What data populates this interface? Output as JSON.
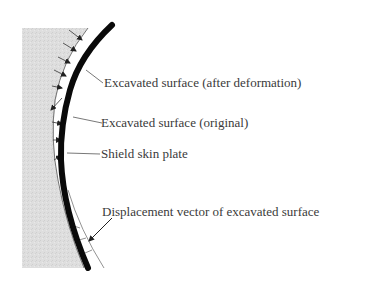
{
  "diagram": {
    "type": "shield-tunnel-cross-section",
    "labels": {
      "after_deformation": "Excavated surface (after deformation)",
      "original": "Excavated surface (original)",
      "skin_plate": "Shield skin plate",
      "displacement": "Displacement vector of excavated surface"
    },
    "colors": {
      "ground": "#dcdcdc",
      "skin_plate": "#0a0a0a",
      "lines": "#555555",
      "text": "#3a3a3a",
      "background": "#ffffff"
    }
  }
}
